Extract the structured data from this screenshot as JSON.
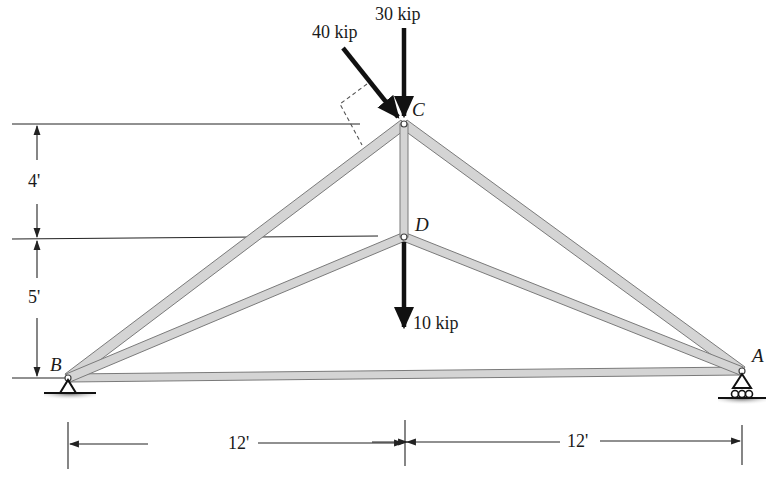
{
  "nodes": {
    "A": {
      "label": "A"
    },
    "B": {
      "label": "B"
    },
    "C": {
      "label": "C"
    },
    "D": {
      "label": "D"
    }
  },
  "loads": {
    "load_30": {
      "label": "30 kip",
      "node": "C",
      "direction": "vertical-down"
    },
    "load_40": {
      "label": "40 kip",
      "node": "C",
      "direction": "inclined, perpendicular to member BC"
    },
    "load_10": {
      "label": "10 kip",
      "node": "D",
      "direction": "vertical-down"
    }
  },
  "dimensions": {
    "vertical_upper": {
      "label": "4'"
    },
    "vertical_lower": {
      "label": "5'"
    },
    "horizontal_left": {
      "label": "12'"
    },
    "horizontal_right": {
      "label": "12'"
    }
  },
  "supports": {
    "B": {
      "type": "pin"
    },
    "A": {
      "type": "roller"
    }
  },
  "members": [
    "BC",
    "CA",
    "BD",
    "DA",
    "CD",
    "BA"
  ],
  "colors": {
    "member_fill": "#d4d4d4",
    "member_stroke": "#7a7a7a",
    "line": "#222222",
    "arrow": "#111111"
  }
}
